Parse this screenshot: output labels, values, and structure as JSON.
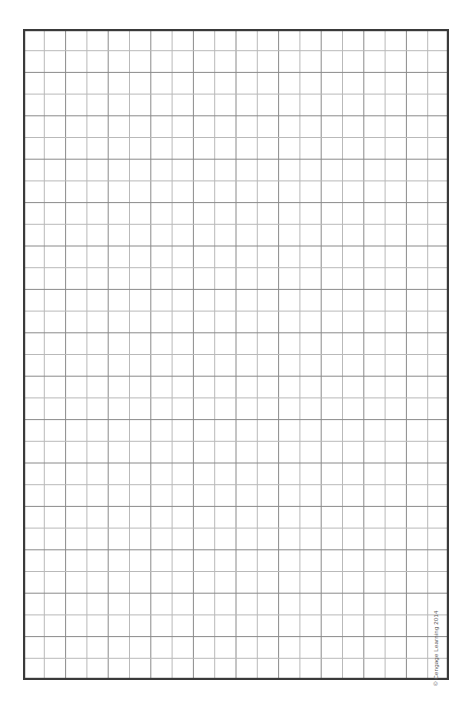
{
  "page": {
    "kind": "graph-paper-worksheet",
    "background_color": "#ffffff",
    "width": 475,
    "height": 714
  },
  "grid": {
    "columns": 20,
    "rows": 30,
    "cell_width": 21.3,
    "cell_height": 21.7,
    "origin_x": 23,
    "origin_y": 29,
    "width": 426,
    "height": 651,
    "line_color": "#8a8a8a",
    "line_color_alt": "#b9b9b9",
    "line_width": 1,
    "border_color": "#3a3a3a",
    "border_width": 2.2,
    "fill_color": "#ffffff"
  },
  "copyright": {
    "text": "© Cengage Learning 2014",
    "color": "#5d5d5d",
    "rotation_degrees": -90
  }
}
